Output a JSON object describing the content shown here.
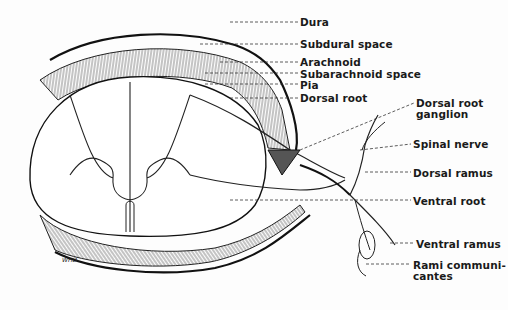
{
  "diagram": {
    "signature": "WHD",
    "colors": {
      "ink": "#1a1a1a",
      "background": "#fdfdfd"
    },
    "labels": [
      {
        "id": "dura",
        "text": "Dura",
        "x": 300,
        "y": 17
      },
      {
        "id": "subdural-space",
        "text": "Subdural space",
        "x": 300,
        "y": 39
      },
      {
        "id": "arachnoid",
        "text": "Arachnoid",
        "x": 300,
        "y": 57
      },
      {
        "id": "subarachnoid-space",
        "text": "Subarachnoid space",
        "x": 300,
        "y": 69
      },
      {
        "id": "pia",
        "text": "Pia",
        "x": 300,
        "y": 80
      },
      {
        "id": "dorsal-root",
        "text": "Dorsal root",
        "x": 300,
        "y": 93
      },
      {
        "id": "dorsal-root-ganglion",
        "text": "Dorsal root",
        "sub": "ganglion",
        "x": 416,
        "y": 98
      },
      {
        "id": "spinal-nerve",
        "text": "Spinal nerve",
        "x": 413,
        "y": 139
      },
      {
        "id": "dorsal-ramus",
        "text": "Dorsal ramus",
        "x": 413,
        "y": 168
      },
      {
        "id": "ventral-root",
        "text": "Ventral root",
        "x": 413,
        "y": 196
      },
      {
        "id": "ventral-ramus",
        "text": "Ventral ramus",
        "x": 416,
        "y": 239
      },
      {
        "id": "rami-communicantes",
        "text": "Rami communi-",
        "sub": "cantes",
        "x": 413,
        "y": 260
      }
    ]
  }
}
